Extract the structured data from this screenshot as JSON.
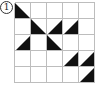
{
  "problem_label": "1",
  "grid": {
    "rows": 5,
    "cols": 5,
    "line_color": "#bdbdbd",
    "fill_color": "#111111",
    "triangles": [
      {
        "row": 0,
        "col": 0,
        "corner": "bottom-left"
      },
      {
        "row": 1,
        "col": 1,
        "corner": "bottom-left"
      },
      {
        "row": 1,
        "col": 2,
        "corner": "bottom-right"
      },
      {
        "row": 1,
        "col": 3,
        "corner": "bottom-right"
      },
      {
        "row": 2,
        "col": 0,
        "corner": "bottom-right"
      },
      {
        "row": 2,
        "col": 2,
        "corner": "bottom-left"
      },
      {
        "row": 3,
        "col": 3,
        "corner": "bottom-right"
      },
      {
        "row": 3,
        "col": 4,
        "corner": "bottom-right"
      },
      {
        "row": 4,
        "col": 4,
        "corner": "bottom-right"
      }
    ]
  }
}
